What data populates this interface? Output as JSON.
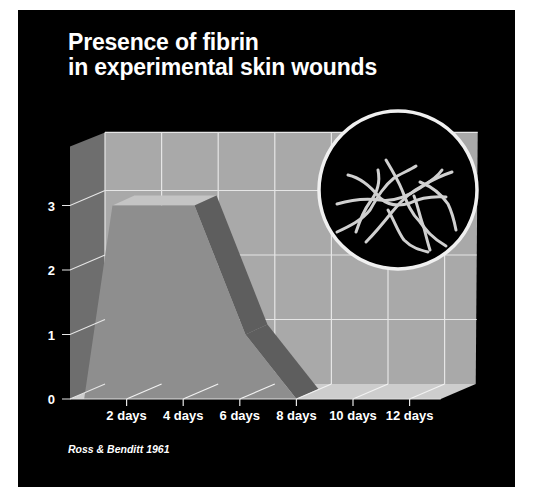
{
  "title": {
    "line1": "Presence of fibrin",
    "line2": "in experimental skin wounds"
  },
  "source": "Ross & Benditt 1961",
  "colors": {
    "background": "#000000",
    "back_wall": "#a9a9a9",
    "side_wall": "#6e6e6e",
    "floor": "#cdcdcd",
    "grid_line": "#e6e6e6",
    "area_front": "#8e8e8e",
    "area_top": "#c4c4c4",
    "area_side": "#5e5e5e",
    "text": "#ffffff",
    "inset_ring": "#f0f0f0",
    "fibrin_strands": "#d0d0d0"
  },
  "inset": {
    "description": "fibrin-strands-illustration",
    "shape": "circle"
  },
  "chart_data": {
    "type": "area",
    "title": "Presence of fibrin in experimental skin wounds",
    "xlabel": "",
    "ylabel": "",
    "x": [
      0,
      2,
      4,
      6,
      8,
      10,
      12
    ],
    "categories": [
      "2 days",
      "4 days",
      "6 days",
      "8 days",
      "10 days",
      "12 days"
    ],
    "y_ticks": [
      "0",
      "1",
      "2",
      "3"
    ],
    "ylim": [
      0,
      3.9
    ],
    "series": [
      {
        "name": "Fibrin presence",
        "x": [
          0.5,
          1.5,
          4.4,
          6.2,
          8.0,
          12
        ],
        "values": [
          0,
          3.0,
          3.0,
          1.0,
          0,
          0
        ]
      }
    ],
    "grid": true,
    "style": "3d",
    "annotation": "Ross & Benditt 1961",
    "legend": null
  }
}
